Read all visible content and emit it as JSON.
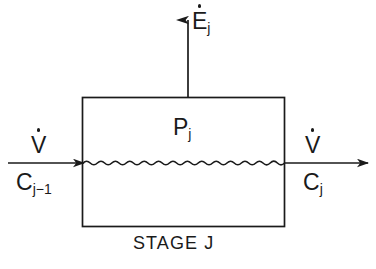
{
  "diagram": {
    "caption": "STAGE J",
    "colors": {
      "background": "#ffffff",
      "stroke": "#1a1a1a",
      "text": "#1a1a1a"
    },
    "box": {
      "name": "stage-vessel",
      "x": 82,
      "y": 97,
      "width": 202,
      "height": 129
    },
    "labels": {
      "energy_out": {
        "base": "E",
        "dot": true,
        "subscript": "j"
      },
      "production": {
        "base": "P",
        "dot": false,
        "subscript": "j"
      },
      "flow_in": {
        "base": "V",
        "dot": true,
        "subscript": ""
      },
      "conc_in": {
        "base": "C",
        "dot": false,
        "subscript": "j−1"
      },
      "flow_out": {
        "base": "V",
        "dot": true,
        "subscript": ""
      },
      "conc_out": {
        "base": "C",
        "dot": false,
        "subscript": "j"
      },
      "stage_caption": "STAGE J"
    },
    "arrows": {
      "energy_out_arrow": {
        "from_x": 188,
        "from_y": 97,
        "to_x": 188,
        "to_y": 18,
        "direction": "up"
      },
      "inlet_arrow": {
        "from_x": 8,
        "from_y": 163,
        "to_x": 84,
        "to_y": 163,
        "direction": "right"
      },
      "outlet_arrow": {
        "from_x": 284,
        "from_y": 163,
        "to_x": 368,
        "to_y": 163,
        "direction": "right"
      }
    },
    "wavy_line": {
      "name": "mixing-wavy-line",
      "x_start": 84,
      "x_end": 284,
      "y": 163,
      "amplitude": 3,
      "cycles": 14
    }
  }
}
